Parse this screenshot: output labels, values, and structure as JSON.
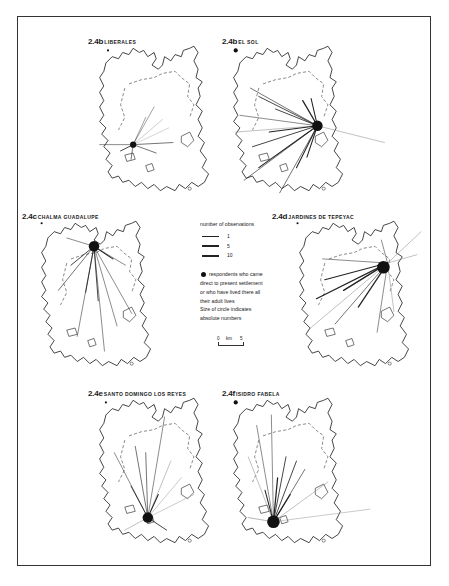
{
  "figure": {
    "panels": [
      {
        "id": "2.4b",
        "number": "2.4b",
        "name": "Liberales",
        "origin_dot": "small"
      },
      {
        "id": "2.4b2",
        "number": "2.4b",
        "name": "El Sol",
        "origin_dot": "large"
      },
      {
        "id": "2.4c",
        "number": "2.4c",
        "name": "Chalma Guadalupe",
        "origin_dot": "small"
      },
      {
        "id": "2.4d",
        "number": "2.4d",
        "name": "Jardines de Tepeyac",
        "origin_dot": "small"
      },
      {
        "id": "2.4e",
        "number": "2.4e",
        "name": "Santo Domingo los Reyes",
        "origin_dot": "small"
      },
      {
        "id": "2.4f",
        "number": "2.4f",
        "name": "Isidro Fabela",
        "origin_dot": "large"
      }
    ],
    "legend": {
      "title": "number of observations",
      "line_weights": [
        {
          "value": "1",
          "thickness": 0.6
        },
        {
          "value": "5",
          "thickness": 1.2
        },
        {
          "value": "10",
          "thickness": 2.0
        }
      ],
      "dot_lines": [
        "respondents who came",
        "direct to present settlement",
        "or who have lived there all",
        "their adult lives",
        "Size of circle indicates",
        "absolute numbers"
      ],
      "scale": {
        "start": "0",
        "unit": "km",
        "end": "5"
      }
    },
    "colors": {
      "ink": "#1a1a1a",
      "frame": "#333333",
      "background": "#ffffff"
    }
  }
}
